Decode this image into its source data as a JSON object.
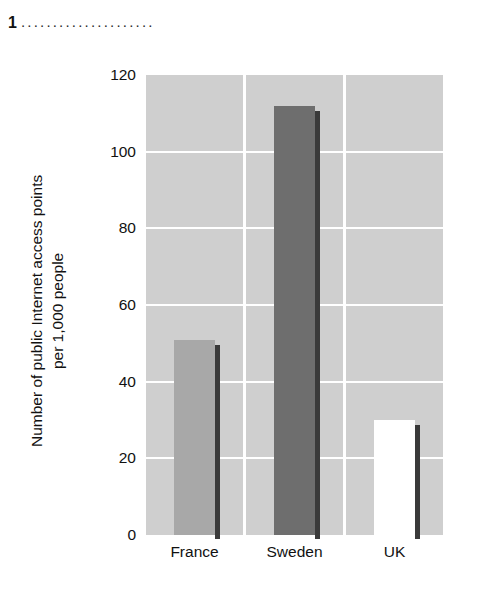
{
  "header": {
    "number": "1",
    "leader_dots": ".....................",
    "icon": "dotted-leader"
  },
  "chart_data": {
    "type": "bar",
    "title": "",
    "subtitle": "",
    "xlabel": "",
    "ylabel": "Number of public Internet access points\nper 1,000 people",
    "categories": [
      "France",
      "Sweden",
      "UK"
    ],
    "values": [
      51,
      112,
      30
    ],
    "series": [
      {
        "name": "Public Internet access points per 1,000 people",
        "values": [
          51,
          112,
          30
        ]
      }
    ],
    "ylim": [
      0,
      120
    ],
    "ytick_labels": [
      "0",
      "20",
      "40",
      "60",
      "80",
      "100",
      "120"
    ],
    "ytick_values": [
      0,
      20,
      40,
      60,
      80,
      100,
      120
    ],
    "grid": true,
    "grid_color": "#ffffff",
    "legend": false,
    "legend_position": "none",
    "panel_background": "#cfcfcf",
    "bar_colors": [
      "#a8a8a8",
      "#6e6e6e",
      "#ffffff"
    ],
    "bar_shadow_color": "#3a3a3a",
    "annotations": []
  }
}
